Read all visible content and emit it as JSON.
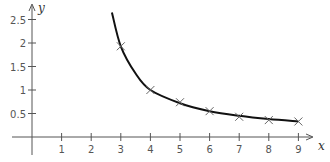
{
  "chart_data": {
    "type": "line",
    "title": "",
    "xlabel": "x",
    "ylabel": "y",
    "x_ticks": [
      "1",
      "2",
      "3",
      "4",
      "5",
      "6",
      "7",
      "8",
      "9"
    ],
    "y_ticks": [
      "0.5",
      "1",
      "1.5",
      "2",
      "2.5"
    ],
    "xlim": [
      0,
      9.5
    ],
    "ylim": [
      0,
      2.7
    ],
    "grid": false,
    "series": [
      {
        "name": "data points",
        "style": "cross-markers",
        "x": [
          3,
          4,
          5,
          6,
          7,
          8,
          9
        ],
        "y": [
          1.93,
          1.0,
          0.74,
          0.55,
          0.43,
          0.36,
          0.33
        ]
      },
      {
        "name": "fitted curve",
        "style": "solid-line",
        "x": [
          2.7,
          3,
          3.5,
          4,
          5,
          6,
          7,
          8,
          9
        ],
        "y": [
          2.65,
          1.93,
          1.35,
          1.0,
          0.72,
          0.55,
          0.45,
          0.38,
          0.33
        ]
      }
    ]
  }
}
